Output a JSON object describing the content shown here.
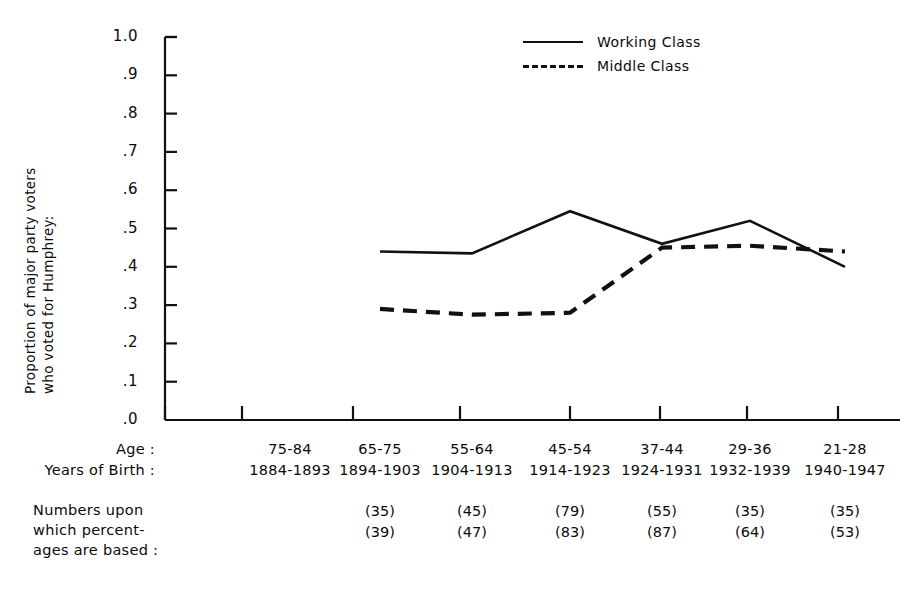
{
  "chart_data": {
    "type": "line",
    "title": "",
    "xlabel": "",
    "ylabel": "Proportion of major party voters who voted for Humphrey:",
    "ylabel_lines": [
      "Proportion of major party voters",
      "who voted for Humphrey:"
    ],
    "ylim": [
      0.0,
      1.0
    ],
    "ytick_labels": [
      "1.0",
      ".9",
      ".8",
      ".7",
      ".6",
      ".5",
      ".4",
      ".3",
      ".2",
      ".1",
      ".0"
    ],
    "ytick_values": [
      1.0,
      0.9,
      0.8,
      0.7,
      0.6,
      0.5,
      0.4,
      0.3,
      0.2,
      0.1,
      0.0
    ],
    "grid": false,
    "legend_position": "top-center-right",
    "categories": [
      "75-84",
      "65-75",
      "55-64",
      "45-54",
      "37-44",
      "29-36",
      "21-28"
    ],
    "series": [
      {
        "name": "Working Class",
        "style": "solid",
        "color": "#111111",
        "values": [
          null,
          0.44,
          0.435,
          0.545,
          0.46,
          0.52,
          0.4
        ]
      },
      {
        "name": "Middle Class",
        "style": "dashed",
        "color": "#111111",
        "values": [
          null,
          0.29,
          0.275,
          0.28,
          0.45,
          0.455,
          0.44
        ]
      }
    ]
  },
  "axes": {
    "x_rows": [
      {
        "title": "Age :",
        "cells": [
          "75-84",
          "65-75",
          "55-64",
          "45-54",
          "37-44",
          "29-36",
          "21-28"
        ]
      },
      {
        "title": "Years of Birth :",
        "cells": [
          "1884-1893",
          "1894-1903",
          "1904-1913",
          "1914-1923",
          "1924-1931",
          "1932-1939",
          "1940-1947"
        ]
      }
    ]
  },
  "note": {
    "lines": [
      "Numbers  upon",
      "which percent-",
      "ages are based :"
    ],
    "working_class_n": [
      "",
      "(35)",
      "(45)",
      "(79)",
      "(55)",
      "(35)",
      "(35)"
    ],
    "middle_class_n": [
      "",
      "(39)",
      "(47)",
      "(83)",
      "(87)",
      "(64)",
      "(53)"
    ]
  },
  "legend": {
    "items": [
      {
        "label": "Working Class",
        "style": "solid"
      },
      {
        "label": "Middle Class",
        "style": "dashed"
      }
    ]
  }
}
